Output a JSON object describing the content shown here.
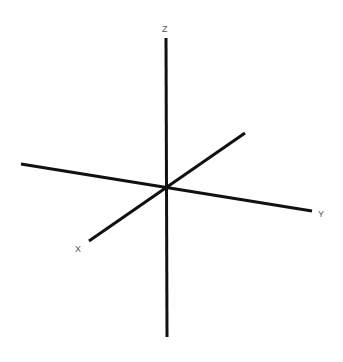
{
  "diagram": {
    "type": "3d-coordinate-axes",
    "axes": [
      {
        "name": "Z",
        "label": "Z",
        "from": [
          166,
          38
        ],
        "to": [
          167,
          337
        ],
        "label_pos": [
          162,
          32
        ]
      },
      {
        "name": "Y",
        "label": "Y",
        "from": [
          21,
          164
        ],
        "to": [
          312,
          211
        ],
        "label_pos": [
          318,
          217
        ]
      },
      {
        "name": "X",
        "label": "X",
        "from": [
          245,
          133
        ],
        "to": [
          89,
          241
        ],
        "label_pos": [
          75,
          252
        ]
      }
    ],
    "origin": [
      166,
      187
    ],
    "colors": {
      "axis": "#111111",
      "label": "#555555",
      "background": "#ffffff"
    }
  }
}
